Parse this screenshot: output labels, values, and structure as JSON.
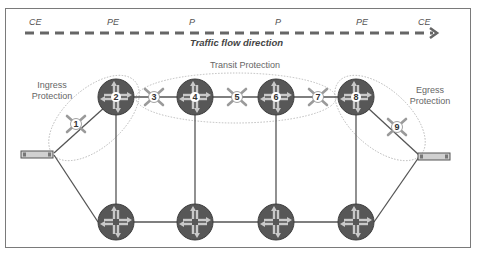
{
  "diagram": {
    "role_labels": [
      {
        "id": "ce-left",
        "text": "CE",
        "x": 30
      },
      {
        "id": "pe-left",
        "text": "PE",
        "x": 107
      },
      {
        "id": "p-left",
        "text": "P",
        "x": 189
      },
      {
        "id": "p-right",
        "text": "P",
        "x": 275
      },
      {
        "id": "pe-right",
        "text": "PE",
        "x": 358
      },
      {
        "id": "ce-right",
        "text": "CE",
        "x": 419
      }
    ],
    "flow_label": "Traffic flow direction",
    "zones": {
      "ingress": "Ingress\nProtection",
      "transit": "Transit Protection",
      "egress": "Egress\nProtection"
    },
    "routers_top": [
      {
        "id": "2",
        "label": "2"
      },
      {
        "id": "4",
        "label": "4"
      },
      {
        "id": "6",
        "label": "6"
      },
      {
        "id": "8",
        "label": "8"
      }
    ],
    "links_protected": [
      {
        "id": "1",
        "label": "1"
      },
      {
        "id": "3",
        "label": "3"
      },
      {
        "id": "5",
        "label": "5"
      },
      {
        "id": "7",
        "label": "7"
      },
      {
        "id": "9",
        "label": "9"
      }
    ],
    "routers_bottom": 4,
    "ce_devices": [
      "left-ce",
      "right-ce"
    ],
    "colors": {
      "router_fill": "#555555",
      "router_arrows": "#c8c8c8",
      "link": "#555555",
      "ellipse": "#aaaaaa",
      "dash": "#666666"
    }
  }
}
